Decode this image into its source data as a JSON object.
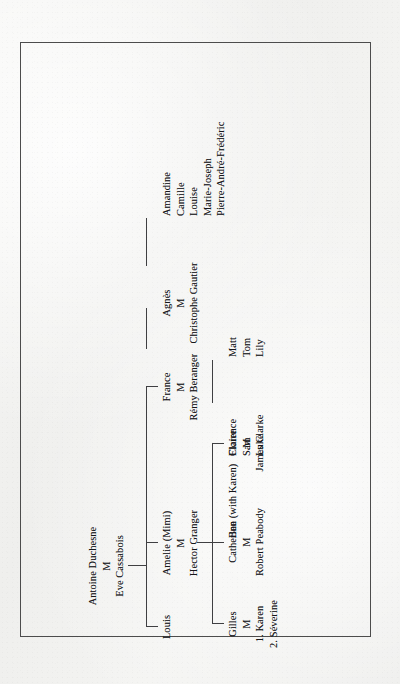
{
  "document": {
    "type": "family-tree-chart",
    "orientation": "rotated-90-ccw",
    "frame_color": "#4c4c4c",
    "ink_color": "#17171a",
    "paper_color": "#f3f3f1"
  },
  "tree": {
    "root": {
      "person_a": "Antoine Duchesne",
      "marriage_mark": "M",
      "person_b": "Eve Cassabois"
    },
    "generation_2": [
      {
        "id": "france",
        "person_a": "France",
        "marriage_mark": "M",
        "person_b": "Rémy Beranger"
      },
      {
        "id": "amelie",
        "person_a": "Amelie (Mimi)",
        "marriage_mark": "M",
        "person_b": "Hector Granger"
      },
      {
        "id": "louis",
        "person_a": "Louis"
      }
    ],
    "generation_3": [
      {
        "id": "agnes",
        "person_a": "Agnès",
        "marriage_mark": "M",
        "person_b": "Christophe Gautier"
      },
      {
        "id": "claire",
        "person_a": "Claire",
        "marriage_mark": "M",
        "person_b": "James Clarke"
      },
      {
        "id": "catherine",
        "person_a": "Catherine",
        "marriage_mark": "M",
        "person_b": "Robert Peabody"
      },
      {
        "id": "gilles",
        "person_a": "Gilles",
        "marriage_mark": "M",
        "spouse_1": "1. Karen",
        "spouse_2": "2. Séverine"
      }
    ],
    "generation_4": [
      {
        "id": "gautier-children",
        "parent": "agnes",
        "children": [
          "Amandine",
          "Camille",
          "Louise",
          "Marie-Joseph",
          "Pierre-André-Frédéric"
        ]
      },
      {
        "id": "clarke-children",
        "parent": "claire",
        "children": [
          "Matt",
          "Tom",
          "Lily"
        ]
      },
      {
        "id": "peabody-children",
        "parent": "catherine",
        "children": [
          "Florence",
          "Sam",
          "Luke"
        ]
      },
      {
        "id": "gilles-children",
        "parent": "gilles",
        "children": [
          "Ben (with Karen)"
        ]
      }
    ]
  }
}
